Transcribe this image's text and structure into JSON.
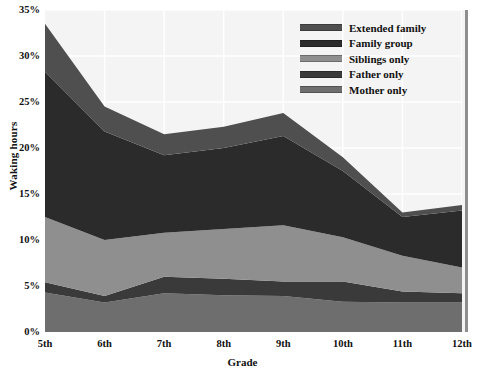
{
  "chart_data": {
    "type": "area",
    "stacked": true,
    "title": "",
    "xlabel": "Grade",
    "ylabel": "Waking hours",
    "categories": [
      "5th",
      "6th",
      "7th",
      "8th",
      "9th",
      "10th",
      "11th",
      "12th"
    ],
    "ylim": [
      0,
      35
    ],
    "ytick_labels": [
      "0%",
      "5%",
      "10%",
      "15%",
      "20%",
      "25%",
      "30%",
      "35%"
    ],
    "ytick_values": [
      0,
      5,
      10,
      15,
      20,
      25,
      30,
      35
    ],
    "y_unit": "%",
    "grid": true,
    "legend_position": "top-right",
    "series": [
      {
        "name": "Mother only",
        "color": "#6e6e6e",
        "values": [
          4.3,
          3.2,
          4.2,
          4.0,
          3.9,
          3.3,
          3.2,
          3.2
        ]
      },
      {
        "name": "Father only",
        "color": "#3a3a3a",
        "values": [
          1.1,
          0.7,
          1.8,
          1.8,
          1.6,
          2.2,
          1.2,
          1.0
        ]
      },
      {
        "name": "Siblings only",
        "color": "#8f8f8f",
        "values": [
          7.1,
          6.1,
          4.8,
          5.4,
          6.1,
          4.8,
          3.9,
          2.8
        ]
      },
      {
        "name": "Family group",
        "color": "#2b2b2b",
        "values": [
          15.8,
          11.8,
          8.4,
          8.8,
          9.7,
          7.2,
          4.2,
          6.2
        ]
      },
      {
        "name": "Extended family",
        "color": "#4f4f4f",
        "values": [
          5.2,
          2.7,
          2.3,
          2.3,
          2.5,
          1.5,
          0.5,
          0.6
        ]
      }
    ],
    "cumulative_tops": {
      "Mother only": [
        4.3,
        3.2,
        4.2,
        4.0,
        3.9,
        3.3,
        3.2,
        3.2
      ],
      "Father only": [
        5.4,
        3.9,
        6.0,
        5.8,
        5.5,
        5.5,
        4.4,
        4.2
      ],
      "Siblings only": [
        12.5,
        10.0,
        10.8,
        11.2,
        11.6,
        10.3,
        8.3,
        7.0
      ],
      "Family group": [
        28.3,
        21.8,
        19.2,
        20.0,
        21.3,
        17.5,
        12.5,
        13.2
      ],
      "Extended family": [
        33.5,
        24.5,
        21.5,
        22.3,
        23.8,
        19.0,
        13.0,
        13.8
      ]
    }
  },
  "legend": {
    "items": [
      {
        "label": "Extended family",
        "color": "#4f4f4f"
      },
      {
        "label": "Family group",
        "color": "#2b2b2b"
      },
      {
        "label": "Siblings only",
        "color": "#8f8f8f"
      },
      {
        "label": "Father only",
        "color": "#3a3a3a"
      },
      {
        "label": "Mother only",
        "color": "#6e6e6e"
      }
    ]
  },
  "axes": {
    "x_title": "Grade",
    "y_title": "Waking hours",
    "x_tick_labels": [
      "5th",
      "6th",
      "7th",
      "8th",
      "9th",
      "10th",
      "11th",
      "12th"
    ],
    "y_tick_labels": [
      "35%",
      "30%",
      "25%",
      "20%",
      "15%",
      "10%",
      "5%",
      "0%"
    ]
  },
  "style": {
    "plot_background": "#f4f4f4",
    "grid_color": "#ffffff",
    "text_color": "#111111",
    "border_color": "#8e8e8e"
  }
}
